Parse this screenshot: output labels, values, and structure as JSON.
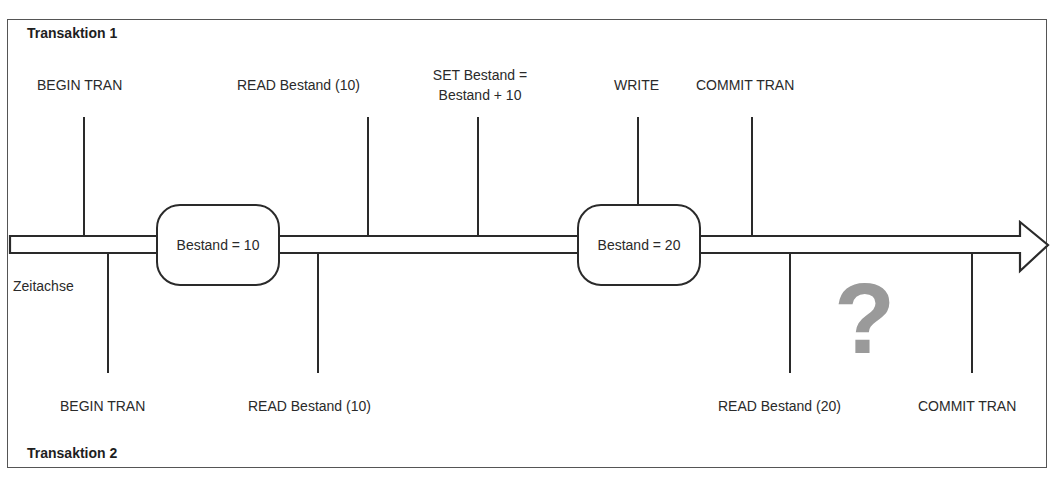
{
  "transaction1": {
    "title": "Transaktion 1",
    "steps": [
      {
        "label": "BEGIN TRAN"
      },
      {
        "label": "READ Bestand (10)"
      },
      {
        "label_line1": "SET Bestand =",
        "label_line2": "Bestand + 10"
      },
      {
        "label": "WRITE"
      },
      {
        "label": "COMMIT TRAN"
      }
    ]
  },
  "transaction2": {
    "title": "Transaktion 2",
    "steps": [
      {
        "label": "BEGIN TRAN"
      },
      {
        "label": "READ Bestand (10)"
      },
      {
        "label": "READ Bestand (20)"
      },
      {
        "label": "COMMIT TRAN"
      }
    ]
  },
  "timeline": {
    "axis_label": "Zeitachse",
    "states": [
      {
        "label": "Bestand = 10"
      },
      {
        "label": "Bestand = 20"
      }
    ],
    "question_mark": "?"
  },
  "colors": {
    "line": "#2a2a2a",
    "frame": "#555555",
    "question_mark": "#9a9a9a"
  }
}
